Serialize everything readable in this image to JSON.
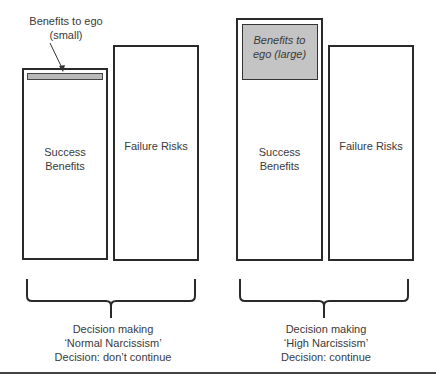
{
  "left_panel": {
    "annotation": [
      "Benefits to ego",
      "(small)"
    ],
    "success_label": [
      "Success",
      "Benefits"
    ],
    "failure_label": "Failure Risks",
    "caption": [
      "Decision making",
      "‘Normal Narcissism’",
      "Decision: don’t continue"
    ]
  },
  "right_panel": {
    "ego_label": [
      "Benefits to",
      "ego (large)"
    ],
    "success_label": [
      "Success",
      "Benefits"
    ],
    "failure_label": "Failure Risks",
    "caption": [
      "Decision making",
      "‘High Narcissism’",
      "Decision: continue"
    ]
  },
  "colors": {
    "border": "#2a2a2a",
    "ego_fill_small": "#b9b9b9",
    "ego_fill_large": "#c4c4c4",
    "text": "#3a3a3a"
  }
}
